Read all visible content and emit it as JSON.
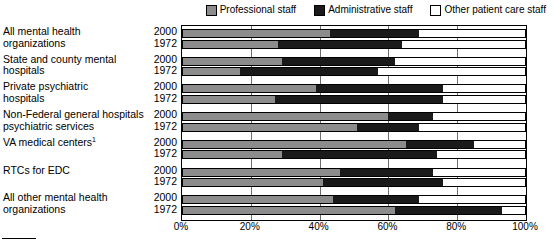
{
  "legend": {
    "items": [
      {
        "label": "Professional staff",
        "color": "#8c8c8c",
        "icon": "square-swatch-gray"
      },
      {
        "label": "Administrative staff",
        "color": "#1a1a1a",
        "icon": "square-swatch-black"
      },
      {
        "label": "Other patient care staff",
        "color": "#ffffff",
        "icon": "square-swatch-white"
      }
    ]
  },
  "axis": {
    "ticks": [
      "0%",
      "20%",
      "40%",
      "60%",
      "80%",
      "100%"
    ],
    "tick_values": [
      0,
      20,
      40,
      60,
      80,
      100
    ],
    "min": 0,
    "max": 100
  },
  "groups": [
    {
      "label_line1": "All mental health",
      "label_line2": "organizations",
      "years": [
        "2000",
        "1972"
      ]
    },
    {
      "label_line1": "State and county mental",
      "label_line2": "hospitals",
      "years": [
        "2000",
        "1972"
      ]
    },
    {
      "label_line1": "Private psychiatric",
      "label_line2": "hospitals",
      "years": [
        "2000",
        "1972"
      ]
    },
    {
      "label_line1": "Non-Federal general hospitals",
      "label_line2": "psychiatric services",
      "years": [
        "2000",
        "1972"
      ]
    },
    {
      "label_line1": "VA medical centers",
      "label_line2": "",
      "footnote": "1",
      "years": [
        "2000",
        "1972"
      ]
    },
    {
      "label_line1": "RTCs for EDC",
      "label_line2": "",
      "years": [
        "2000",
        "1972"
      ]
    },
    {
      "label_line1": "All other mental health",
      "label_line2": "organizations",
      "years": [
        "2000",
        "1972"
      ]
    }
  ],
  "chart_data": {
    "type": "bar",
    "orientation": "horizontal",
    "stacked": true,
    "title": "",
    "xlabel": "",
    "ylabel": "",
    "xlim": [
      0,
      100
    ],
    "grid": true,
    "legend_position": "top-right",
    "series": [
      {
        "name": "Professional staff",
        "color": "#8c8c8c"
      },
      {
        "name": "Administrative staff",
        "color": "#1a1a1a"
      },
      {
        "name": "Other patient care staff",
        "color": "#ffffff"
      }
    ],
    "categories": [
      "All mental health organizations",
      "State and county mental hospitals",
      "Private psychiatric hospitals",
      "Non-Federal general hospitals psychiatric services",
      "VA medical centers",
      "RTCs for EDC",
      "All other mental health organizations"
    ],
    "rows": [
      {
        "category": "All mental health organizations",
        "year": "2000",
        "professional": 43,
        "administrative": 26,
        "other": 31
      },
      {
        "category": "All mental health organizations",
        "year": "1972",
        "professional": 28,
        "administrative": 36,
        "other": 36
      },
      {
        "category": "State and county mental hospitals",
        "year": "2000",
        "professional": 29,
        "administrative": 33,
        "other": 38
      },
      {
        "category": "State and county mental hospitals",
        "year": "1972",
        "professional": 17,
        "administrative": 40,
        "other": 43
      },
      {
        "category": "Private psychiatric hospitals",
        "year": "2000",
        "professional": 39,
        "administrative": 37,
        "other": 24
      },
      {
        "category": "Private psychiatric hospitals",
        "year": "1972",
        "professional": 27,
        "administrative": 49,
        "other": 24
      },
      {
        "category": "Non-Federal general hospitals psychiatric services",
        "year": "2000",
        "professional": 60,
        "administrative": 13,
        "other": 27
      },
      {
        "category": "Non-Federal general hospitals psychiatric services",
        "year": "1972",
        "professional": 51,
        "administrative": 18,
        "other": 31
      },
      {
        "category": "VA medical centers",
        "year": "2000",
        "professional": 65,
        "administrative": 20,
        "other": 15
      },
      {
        "category": "VA medical centers",
        "year": "1972",
        "professional": 29,
        "administrative": 45,
        "other": 26
      },
      {
        "category": "RTCs for EDC",
        "year": "2000",
        "professional": 46,
        "administrative": 27,
        "other": 27
      },
      {
        "category": "RTCs for EDC",
        "year": "1972",
        "professional": 41,
        "administrative": 35,
        "other": 24
      },
      {
        "category": "All other mental health organizations",
        "year": "2000",
        "professional": 44,
        "administrative": 25,
        "other": 31
      },
      {
        "category": "All other mental health organizations",
        "year": "1972",
        "professional": 62,
        "administrative": 31,
        "other": 7
      }
    ]
  }
}
